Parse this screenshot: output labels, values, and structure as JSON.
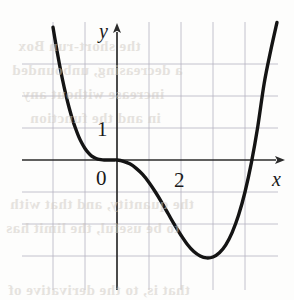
{
  "figure": {
    "kind": "cartesian-graph",
    "background_color": "#fdfdfc",
    "curve_color": "#141414",
    "axis_color": "#2b2b2b",
    "grid_color": "#a9a6b8",
    "label_color": "#1a1a1a",
    "bleed_color": "#cfc9c2"
  },
  "axes": {
    "x_axis_label": "x",
    "y_axis_label": "y",
    "origin_label": "0",
    "x_tick_labels": [
      {
        "text": "2",
        "value": 2
      }
    ],
    "y_tick_labels": [
      {
        "text": "1",
        "value": 1
      }
    ],
    "x_axis_arrow": "arrow-right",
    "y_axis_arrow": "arrow-up",
    "grid_visible": true,
    "grid_spacing_units": 1
  },
  "chart_data": {
    "type": "line",
    "title": "",
    "xlabel": "x",
    "ylabel": "y",
    "xlim": [
      -2,
      5.5
    ],
    "ylim": [
      -3.5,
      4.5
    ],
    "grid": true,
    "legend": "none",
    "annotations": [
      {
        "text": "1",
        "x": -0.35,
        "y": 1.0,
        "note": "y-axis tick label"
      },
      {
        "text": "0",
        "x": -0.42,
        "y": -0.42,
        "note": "origin label"
      },
      {
        "text": "2",
        "x": 1.92,
        "y": -0.45,
        "note": "x-axis tick label"
      },
      {
        "text": "y",
        "x": -0.35,
        "y": 4.25,
        "note": "y-axis name"
      },
      {
        "text": "x",
        "x": 5.3,
        "y": -0.5,
        "note": "x-axis name"
      }
    ],
    "series": [
      {
        "name": "f",
        "x": [
          -2.0,
          -1.9,
          -1.8,
          -1.7,
          -1.6,
          -1.5,
          -1.4,
          -1.3,
          -1.2,
          -1.1,
          -1.0,
          -0.9,
          -0.8,
          -0.7,
          -0.6,
          -0.5,
          -0.4,
          -0.3,
          -0.2,
          -0.1,
          0.0,
          0.2,
          0.4,
          0.6,
          0.8,
          1.0,
          1.2,
          1.4,
          1.6,
          1.8,
          2.0,
          2.2,
          2.4,
          2.6,
          2.8,
          3.0,
          3.2,
          3.4,
          3.6,
          3.8,
          4.0,
          4.2,
          4.4,
          4.6,
          4.8,
          5.0
        ],
        "y": [
          4.15,
          3.55,
          3.0,
          2.5,
          2.05,
          1.65,
          1.3,
          1.0,
          0.74,
          0.53,
          0.36,
          0.23,
          0.13,
          0.07,
          0.03,
          0.01,
          0.0,
          0.0,
          0.0,
          0.0,
          0.0,
          -0.04,
          -0.12,
          -0.26,
          -0.45,
          -0.7,
          -1.0,
          -1.33,
          -1.68,
          -2.03,
          -2.35,
          -2.64,
          -2.86,
          -3.0,
          -3.06,
          -3.03,
          -2.9,
          -2.65,
          -2.26,
          -1.72,
          -1.0,
          -0.08,
          1.05,
          2.4,
          3.4,
          4.3
        ]
      }
    ],
    "features": {
      "flat_tangent_interval": [
        -0.4,
        0.35
      ],
      "local_minimum": {
        "x": 2.95,
        "y": -3.06
      },
      "x_intercepts": [
        0.0,
        4.25
      ],
      "behavior_left": "increases steeply upward",
      "behavior_right": "increases steeply upward"
    }
  },
  "bleed_through": [
    {
      "text": "the short-run Box",
      "left": 18,
      "top": 38,
      "size": 15
    },
    {
      "text": "a decreasing, unbounded",
      "left": 12,
      "top": 62,
      "size": 15
    },
    {
      "text": "increase without any",
      "left": 22,
      "top": 86,
      "size": 15
    },
    {
      "text": "in and the function",
      "left": 30,
      "top": 110,
      "size": 15
    },
    {
      "text": "the quantity, and that with",
      "left": 10,
      "top": 196,
      "size": 15
    },
    {
      "text": "to be useful, the limit has",
      "left": 6,
      "top": 220,
      "size": 15
    },
    {
      "text": "that is, to the derivative of",
      "left": 8,
      "top": 282,
      "size": 15
    }
  ]
}
